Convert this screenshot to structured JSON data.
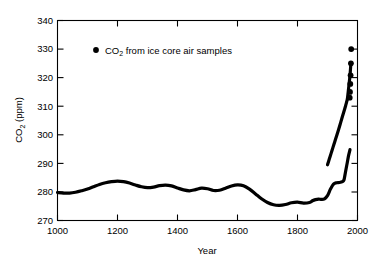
{
  "chart_data": {
    "type": "line",
    "title": "",
    "xlabel": "Year",
    "ylabel": "CO2 (ppm)",
    "ylabel_rich": {
      "base": "CO",
      "sub": "2",
      "tail": " (ppm)"
    },
    "xlim": [
      1000,
      2000
    ],
    "ylim": [
      270,
      340
    ],
    "xticks": [
      1000,
      1200,
      1400,
      1600,
      1800,
      2000
    ],
    "xtick_labels": [
      "1000",
      "1200",
      "1400",
      "1600",
      "1800",
      "2000"
    ],
    "yticks": [
      270,
      280,
      290,
      300,
      310,
      320,
      330,
      340
    ],
    "ytick_labels": [
      "270",
      "280",
      "290",
      "300",
      "310",
      "320",
      "330",
      "340"
    ],
    "grid": false,
    "legend_position": "top-left-inside",
    "series": [
      {
        "name": "CO2 from ice core air samples",
        "name_rich": {
          "base": "CO",
          "sub": "2",
          "tail": " from ice core air samples"
        },
        "marker": "filled-circle",
        "color": "#000000",
        "x": [
          1000,
          1020,
          1040,
          1060,
          1080,
          1100,
          1120,
          1140,
          1160,
          1180,
          1200,
          1220,
          1240,
          1260,
          1280,
          1300,
          1320,
          1340,
          1360,
          1380,
          1400,
          1420,
          1440,
          1460,
          1480,
          1500,
          1520,
          1540,
          1560,
          1580,
          1600,
          1620,
          1640,
          1660,
          1680,
          1700,
          1720,
          1740,
          1760,
          1780,
          1800,
          1820,
          1840,
          1850,
          1860,
          1870,
          1880,
          1890,
          1900,
          1910,
          1920,
          1930,
          1940,
          1950,
          1955,
          1958,
          1962,
          1966,
          1970,
          1975
        ],
        "y": [
          279.8,
          279.6,
          279.6,
          279.9,
          280.4,
          281.0,
          281.8,
          282.6,
          283.2,
          283.6,
          283.8,
          283.6,
          283.1,
          282.4,
          281.8,
          281.5,
          281.7,
          282.2,
          282.4,
          282.1,
          281.4,
          280.7,
          280.4,
          280.8,
          281.3,
          281.1,
          280.5,
          280.6,
          281.3,
          282.1,
          282.5,
          282.2,
          281.0,
          279.3,
          277.6,
          276.3,
          275.5,
          275.3,
          275.6,
          276.2,
          276.4,
          276.1,
          276.3,
          276.9,
          277.3,
          277.5,
          277.4,
          277.6,
          278.7,
          281.0,
          282.7,
          283.2,
          283.3,
          283.6,
          284.2,
          285.8,
          288.1,
          290.3,
          292.6,
          294.8
        ]
      },
      {
        "name": "CO2 modern rise segment",
        "marker": "filled-circle",
        "color": "#000000",
        "x": [
          1900,
          1906,
          1912,
          1918,
          1924,
          1930,
          1936,
          1942,
          1948,
          1952,
          1956,
          1960,
          1963,
          1966,
          1969,
          1972,
          1975,
          1978
        ],
        "y": [
          289.5,
          291.5,
          293.5,
          295.5,
          297.5,
          299.5,
          301.5,
          303.6,
          305.8,
          307.2,
          308.6,
          310.0,
          311.2,
          312.4,
          315.0,
          317.8,
          320.8,
          325.0
        ]
      }
    ],
    "isolated_points": [
      {
        "x": 1979,
        "y": 330.0
      },
      {
        "x": 1978,
        "y": 325.0
      },
      {
        "x": 1977,
        "y": 320.8
      },
      {
        "x": 1976,
        "y": 317.8
      },
      {
        "x": 1975,
        "y": 315.0
      },
      {
        "x": 1974,
        "y": 313.0
      }
    ],
    "annotations": []
  },
  "legend": {
    "marker_name": "filled-circle-marker",
    "label_base": "CO",
    "label_sub": "2",
    "label_tail": " from ice core air samples"
  },
  "axes": {
    "y_title_base": "CO",
    "y_title_sub": "2",
    "y_title_tail": " (ppm)",
    "x_title": "Year"
  },
  "colors": {
    "background": "#ffffff",
    "foreground": "#000000",
    "series": "#000000"
  }
}
